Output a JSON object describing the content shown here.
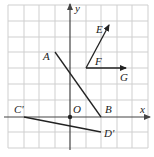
{
  "diagram": {
    "type": "coordinate-grid",
    "grid": {
      "unit_px": 15.5,
      "origin_px": [
        70,
        117
      ],
      "x_range": [
        -4,
        5
      ],
      "y_range": [
        -2,
        7
      ],
      "color": "#cfcfcf"
    },
    "axes": {
      "x_label": "x",
      "y_label": "y",
      "color": "#555555"
    },
    "origin": {
      "label": "O",
      "coord": [
        0,
        0
      ]
    },
    "segments": [
      {
        "name": "AB",
        "from": {
          "label": "A",
          "coord": [
            -1,
            4.2
          ]
        },
        "to": {
          "label": "B",
          "coord": [
            2,
            0
          ]
        },
        "arrow": false
      },
      {
        "name": "C'D'",
        "from": {
          "label": "C'",
          "coord": [
            -4,
            0
          ]
        },
        "to": {
          "label": "D'",
          "coord": [
            2,
            -1
          ]
        },
        "arrow": false
      },
      {
        "name": "FE",
        "from": {
          "label": "F",
          "coord": [
            1,
            3
          ]
        },
        "to": {
          "label": "E",
          "coord": [
            2.5,
            6
          ]
        },
        "arrow": true
      },
      {
        "name": "FG",
        "from": {
          "label": "F",
          "coord": [
            1,
            3
          ]
        },
        "to": {
          "label": "G",
          "coord": [
            3.5,
            3
          ]
        },
        "arrow": true
      }
    ],
    "labels": {
      "A": "A",
      "B": "B",
      "E": "E",
      "F": "F",
      "G": "G",
      "C_prime": "C'",
      "D_prime": "D'",
      "O": "O",
      "x": "x",
      "y": "y"
    },
    "line_color": "#222222"
  }
}
